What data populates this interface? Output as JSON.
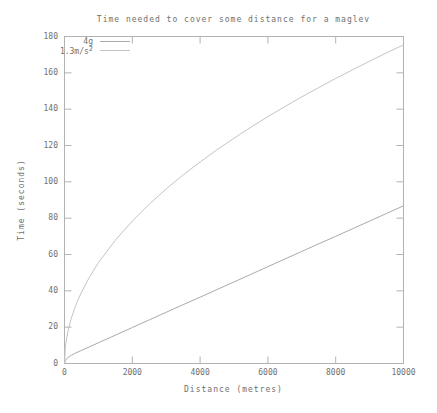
{
  "title": "Time needed to cover some distance for a maglev",
  "colors": {
    "background": "#ffffff",
    "text": "#6f6f6f",
    "axis": "#b2b2b2",
    "series_4g": "#a6abad",
    "series_13": "#c0c6c4"
  },
  "legend": {
    "entries": [
      {
        "label": "4g",
        "sup": ""
      },
      {
        "label": "1.3m/s",
        "sup": "2"
      }
    ]
  },
  "chart_data": {
    "type": "line",
    "title": "Time needed to cover some distance for a maglev",
    "xlabel": "Distance (metres)",
    "ylabel": "Time (seconds)",
    "xlim": [
      0,
      10000
    ],
    "ylim": [
      0,
      180
    ],
    "xticks": [
      0,
      2000,
      4000,
      6000,
      8000,
      10000
    ],
    "yticks": [
      0,
      20,
      40,
      60,
      80,
      100,
      120,
      140,
      160,
      180
    ],
    "grid": false,
    "legend_position": "top-left-inside",
    "x": [
      0,
      25,
      50,
      100,
      150,
      200,
      300,
      400,
      500,
      750,
      1000,
      1500,
      2000,
      2500,
      3000,
      3500,
      4000,
      4500,
      5000,
      5500,
      6000,
      6500,
      7000,
      7500,
      8000,
      8500,
      9000,
      9500,
      10000
    ],
    "series": [
      {
        "name": "4g",
        "color": "#a6abad",
        "values": [
          0,
          1.6,
          2.3,
          3.2,
          3.9,
          4.5,
          5.5,
          6.4,
          7.2,
          9.3,
          11.4,
          15.6,
          19.8,
          24.0,
          28.2,
          32.4,
          36.5,
          40.7,
          44.9,
          49.1,
          53.3,
          57.5,
          61.7,
          65.9,
          70.0,
          74.2,
          78.4,
          82.6,
          86.8
        ]
      },
      {
        "name": "1.3m/s^2",
        "color": "#c0c6c4",
        "values": [
          0,
          8.8,
          12.4,
          17.5,
          21.5,
          24.8,
          30.4,
          35.1,
          39.2,
          48.0,
          55.5,
          67.9,
          78.4,
          87.7,
          96.1,
          103.8,
          110.9,
          117.7,
          124.0,
          130.1,
          135.9,
          141.4,
          146.8,
          151.9,
          156.9,
          161.7,
          166.4,
          171.0,
          175.4
        ]
      }
    ]
  }
}
